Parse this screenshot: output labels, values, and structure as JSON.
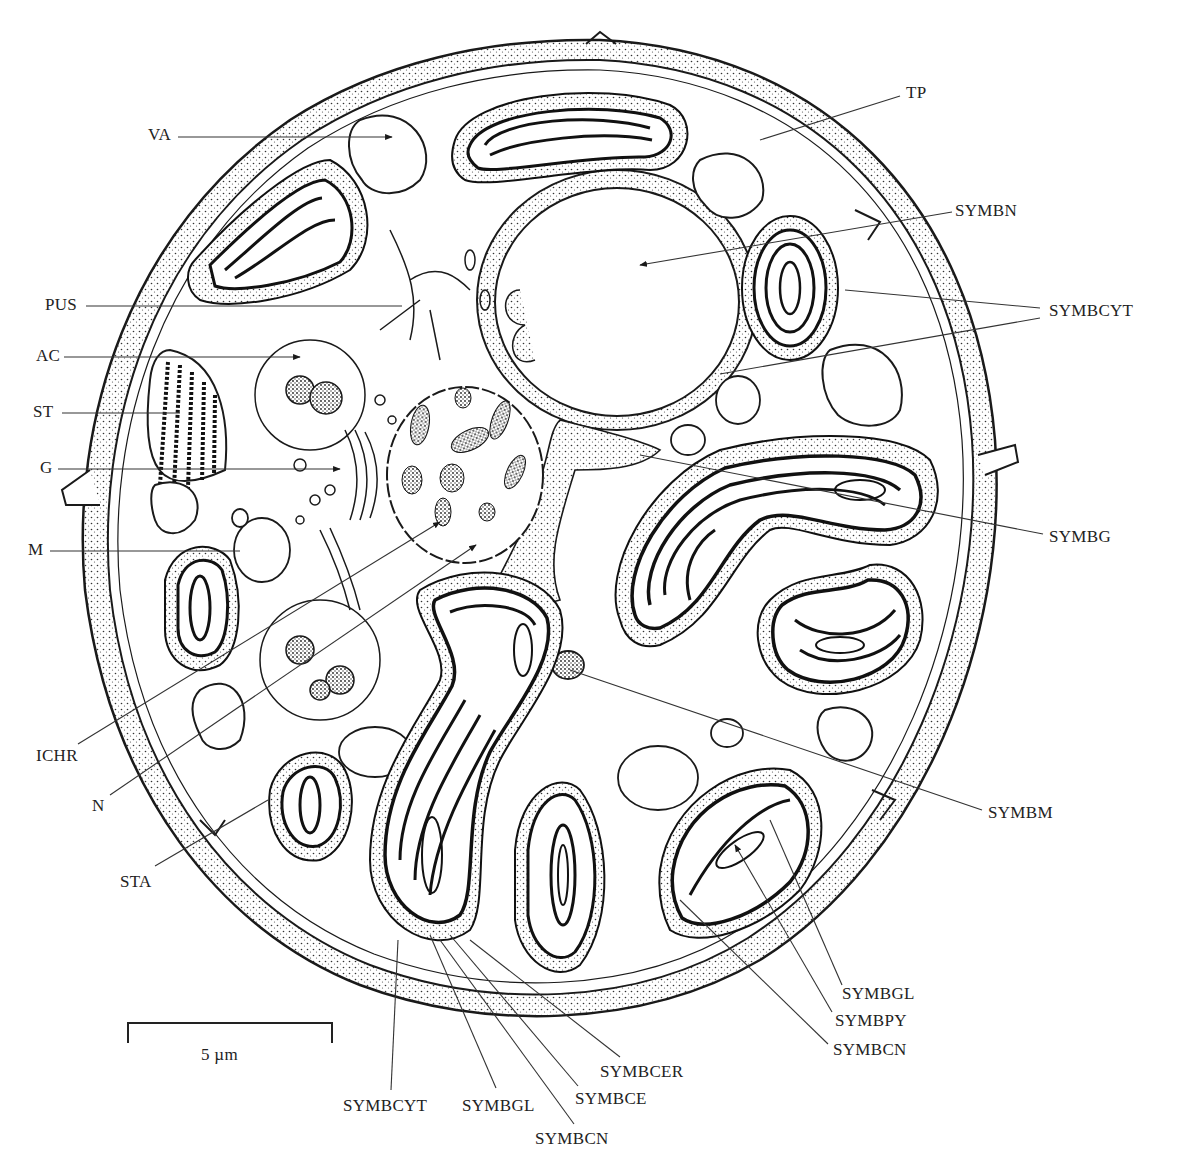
{
  "figure": {
    "type": "diagram",
    "ink_color": "#1a1a1a",
    "background": "#ffffff"
  },
  "labels": [
    {
      "id": "VA",
      "text": "VA",
      "x": 148,
      "y": 141,
      "anchor": "start",
      "line": [
        [
          178,
          137
        ],
        [
          392,
          137
        ]
      ],
      "arrow": true
    },
    {
      "id": "PUS",
      "text": "PUS",
      "x": 45,
      "y": 311,
      "anchor": "start",
      "line": [
        [
          86,
          306
        ],
        [
          402,
          306
        ]
      ],
      "arrow": false
    },
    {
      "id": "AC",
      "text": "AC",
      "x": 36,
      "y": 362,
      "anchor": "start",
      "line": [
        [
          64,
          357
        ],
        [
          300,
          357
        ]
      ],
      "arrow": true
    },
    {
      "id": "ST",
      "text": "ST",
      "x": 33,
      "y": 418,
      "anchor": "start",
      "line": [
        [
          62,
          413
        ],
        [
          180,
          413
        ]
      ],
      "arrow": false
    },
    {
      "id": "G",
      "text": "G",
      "x": 40,
      "y": 474,
      "anchor": "start",
      "line": [
        [
          58,
          469
        ],
        [
          340,
          469
        ]
      ],
      "arrow": true
    },
    {
      "id": "M",
      "text": "M",
      "x": 28,
      "y": 556,
      "anchor": "start",
      "line": [
        [
          50,
          551
        ],
        [
          240,
          551
        ]
      ],
      "arrow": false
    },
    {
      "id": "ICHR",
      "text": "ICHR",
      "x": 36,
      "y": 762,
      "anchor": "start",
      "line": [
        [
          78,
          744
        ],
        [
          440,
          522
        ]
      ],
      "arrow": true
    },
    {
      "id": "N",
      "text": "N",
      "x": 92,
      "y": 812,
      "anchor": "start",
      "line": [
        [
          110,
          795
        ],
        [
          476,
          545
        ]
      ],
      "arrow": true
    },
    {
      "id": "STA",
      "text": "STA",
      "x": 120,
      "y": 888,
      "anchor": "start",
      "line": [
        [
          155,
          866
        ],
        [
          268,
          800
        ]
      ],
      "arrow": false
    },
    {
      "id": "TP",
      "text": "TP",
      "x": 906,
      "y": 99,
      "anchor": "start",
      "line": [
        [
          900,
          96
        ],
        [
          760,
          140
        ]
      ],
      "arrow": false
    },
    {
      "id": "SYMBN",
      "text": "SYMBN",
      "x": 955,
      "y": 217,
      "anchor": "start",
      "line": [
        [
          952,
          212
        ],
        [
          640,
          265
        ]
      ],
      "arrow": true
    },
    {
      "id": "SYMBCYT_R",
      "text": "SYMBCYT",
      "x": 1049,
      "y": 317,
      "anchor": "start",
      "line": [
        [
          1040,
          308
        ],
        [
          845,
          290
        ]
      ],
      "arrow": false
    },
    {
      "id": "SYMBCYT_R2",
      "text": "",
      "x": 0,
      "y": 0,
      "anchor": "start",
      "line": [
        [
          1040,
          318
        ],
        [
          720,
          374
        ]
      ],
      "arrow": false
    },
    {
      "id": "SYMBG",
      "text": "SYMBG",
      "x": 1049,
      "y": 543,
      "anchor": "start",
      "line": [
        [
          1043,
          534
        ],
        [
          640,
          455
        ]
      ],
      "arrow": false
    },
    {
      "id": "SYMBM",
      "text": "SYMBM",
      "x": 988,
      "y": 819,
      "anchor": "start",
      "line": [
        [
          982,
          810
        ],
        [
          570,
          670
        ]
      ],
      "arrow": false
    },
    {
      "id": "SYMBGL_R",
      "text": "SYMBGL",
      "x": 842,
      "y": 1000,
      "anchor": "start",
      "line": [
        [
          842,
          985
        ],
        [
          770,
          820
        ]
      ],
      "arrow": false
    },
    {
      "id": "SYMBPY",
      "text": "SYMBPY",
      "x": 835,
      "y": 1027,
      "anchor": "start",
      "line": [
        [
          832,
          1012
        ],
        [
          735,
          845
        ]
      ],
      "arrow": true
    },
    {
      "id": "SYMBCN_R",
      "text": "SYMBCN",
      "x": 833,
      "y": 1056,
      "anchor": "start",
      "line": [
        [
          828,
          1044
        ],
        [
          680,
          900
        ]
      ],
      "arrow": false
    },
    {
      "id": "SYMBCYT_B",
      "text": "SYMBCYT",
      "x": 343,
      "y": 1112,
      "anchor": "start",
      "line": [
        [
          391,
          1090
        ],
        [
          398,
          940
        ]
      ],
      "arrow": false
    },
    {
      "id": "SYMBGL_B",
      "text": "SYMBGL",
      "x": 462,
      "y": 1112,
      "anchor": "start",
      "line": [
        [
          496,
          1088
        ],
        [
          430,
          935
        ]
      ],
      "arrow": false
    },
    {
      "id": "SYMBCE",
      "text": "SYMBCE",
      "x": 575,
      "y": 1105,
      "anchor": "start",
      "line": [
        [
          578,
          1086
        ],
        [
          450,
          935
        ]
      ],
      "arrow": false
    },
    {
      "id": "SYMBCER",
      "text": "SYMBCER",
      "x": 600,
      "y": 1078,
      "anchor": "start",
      "line": [
        [
          620,
          1057
        ],
        [
          470,
          940
        ]
      ],
      "arrow": false
    },
    {
      "id": "SYMBCN_B",
      "text": "SYMBCN",
      "x": 535,
      "y": 1145,
      "anchor": "start",
      "line": [
        [
          574,
          1124
        ],
        [
          440,
          940
        ]
      ],
      "arrow": false
    }
  ],
  "scale_bar": {
    "label": "5 µm",
    "x1": 128,
    "x2": 332,
    "y": 1023,
    "tick_height": 20,
    "label_x": 213,
    "label_y": 1061
  }
}
